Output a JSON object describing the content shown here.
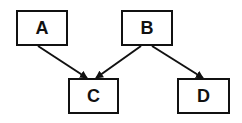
{
  "diagram": {
    "type": "directed-graph",
    "nodes": [
      {
        "id": "A",
        "label": "A"
      },
      {
        "id": "B",
        "label": "B"
      },
      {
        "id": "C",
        "label": "C"
      },
      {
        "id": "D",
        "label": "D"
      }
    ],
    "edges": [
      {
        "from": "A",
        "to": "C"
      },
      {
        "from": "B",
        "to": "C"
      },
      {
        "from": "B",
        "to": "D"
      }
    ],
    "colors": {
      "stroke": "#111111",
      "fill": "#ffffff"
    }
  }
}
